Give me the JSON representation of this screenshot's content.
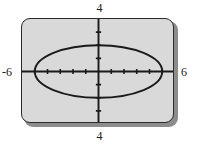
{
  "figure": {
    "kind": "graphing-calculator-screen",
    "background_color": "#ffffff",
    "screen_fill_color": "#d9d9d9",
    "screen_border_color": "#2b2b2b",
    "curve_color": "#1a1a1a",
    "axis_color": "#1a1a1a"
  },
  "window_labels": {
    "top": "4",
    "bottom": "4",
    "left": "-6",
    "right": "6"
  },
  "chart_data": {
    "type": "line",
    "title": "",
    "subtitle": "",
    "xlabel": "",
    "ylabel": "",
    "xlim": [
      -6,
      6
    ],
    "ylim": [
      -4,
      4
    ],
    "grid": false,
    "legend": null,
    "axes": {
      "x_axis_visible": true,
      "y_axis_visible": true,
      "x_tick_spacing": 1,
      "y_tick_spacing": 1,
      "x_ticks": [
        -5,
        -4,
        -3,
        -2,
        -1,
        1,
        2,
        3,
        4,
        5
      ],
      "y_ticks": [
        -3,
        -2,
        -1,
        1,
        2,
        3
      ],
      "tick_labels_shown": false
    },
    "annotations": [
      {
        "text": "4",
        "position": "above-screen-top",
        "meaning": "Ymax"
      },
      {
        "text": "4",
        "position": "below-screen-bottom",
        "meaning": "Ymin magnitude"
      },
      {
        "text": "-6",
        "position": "left-of-screen",
        "meaning": "Xmin"
      },
      {
        "text": "6",
        "position": "right-of-screen",
        "meaning": "Xmax"
      }
    ],
    "series": [
      {
        "name": "ellipse",
        "shape": "ellipse",
        "center": [
          0,
          0
        ],
        "semi_axis_x": 5,
        "semi_axis_y": 2,
        "equation": "x^2/25 + y^2/4 = 1",
        "x_intercepts": [
          -5,
          5
        ],
        "y_intercepts": [
          -2,
          2
        ],
        "closed": true,
        "stroke_color": "#1a1a1a"
      }
    ]
  }
}
